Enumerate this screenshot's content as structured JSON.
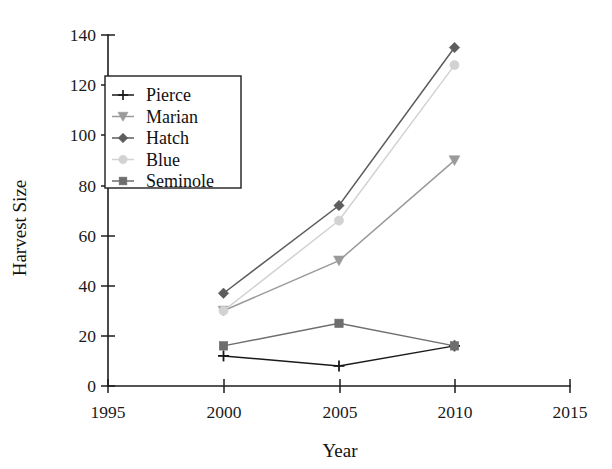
{
  "chart_data": {
    "type": "line",
    "title": "",
    "xlabel": "Year",
    "ylabel": "Harvest Size",
    "x": [
      2000,
      2005,
      2010
    ],
    "xlim": [
      1995,
      2015
    ],
    "ylim": [
      0,
      140
    ],
    "xticks": [
      "1995",
      "2000",
      "2005",
      "2010",
      "2015"
    ],
    "yticks": [
      "0",
      "20",
      "40",
      "60",
      "80",
      "100",
      "120",
      "140"
    ],
    "grid": false,
    "legend_position": "upper left",
    "series": [
      {
        "name": "Pierce",
        "values": [
          12,
          8,
          16
        ],
        "color": "#1a1a1a",
        "marker": "plus"
      },
      {
        "name": "Marian",
        "values": [
          30,
          50,
          90
        ],
        "color": "#9a9a9a",
        "marker": "triangle-down"
      },
      {
        "name": "Hatch",
        "values": [
          37,
          72,
          135
        ],
        "color": "#5d5d5d",
        "marker": "diamond"
      },
      {
        "name": "Blue",
        "values": [
          30,
          66,
          128
        ],
        "color": "#d2d2d2",
        "marker": "circle"
      },
      {
        "name": "Seminole",
        "values": [
          16,
          25,
          16
        ],
        "color": "#6e6e6e",
        "marker": "square"
      }
    ]
  },
  "axes": {
    "y_title": "Harvest Size",
    "x_title": "Year",
    "y_tick_labels": [
      "140",
      "120",
      "100",
      "80",
      "60",
      "40",
      "20",
      "0"
    ],
    "x_tick_labels": [
      "1995",
      "2000",
      "2005",
      "2010",
      "2015"
    ]
  },
  "legend": {
    "entries": [
      {
        "label": "Pierce"
      },
      {
        "label": "Marian"
      },
      {
        "label": "Hatch"
      },
      {
        "label": "Blue"
      },
      {
        "label": "Seminole"
      }
    ]
  }
}
